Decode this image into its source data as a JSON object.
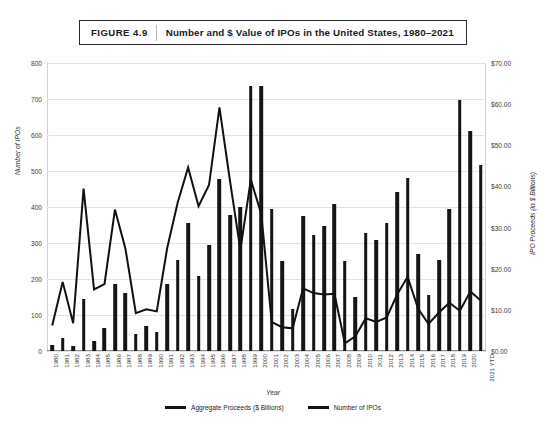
{
  "figure": {
    "number_label": "FIGURE 4.9",
    "title": "Number and $ Value of IPOs in the United States, 1980–2021"
  },
  "axes": {
    "x_title": "Year",
    "y_left_title": "Number of IPOs",
    "y_right_title": "IPO Proceeds (in $ Billions)"
  },
  "legend": {
    "items": [
      {
        "label": "Aggregate Proceeds ($ Billions)",
        "marker": "bar-swatch"
      },
      {
        "label": "Number of IPOs",
        "marker": "line-swatch"
      }
    ]
  },
  "chart_data": {
    "type": "bar",
    "title": "Number and $ Value of IPOs in the United States, 1980–2021",
    "xlabel": "Year",
    "ylabel": "Number of IPOs",
    "y2label": "IPO Proceeds (in $ Billions)",
    "ylim": [
      0,
      800
    ],
    "y2lim": [
      0,
      70
    ],
    "yticks": [
      0,
      100,
      200,
      300,
      400,
      500,
      600,
      700,
      800
    ],
    "ytick_labels": [
      "0",
      "100",
      "200",
      "300",
      "400",
      "500",
      "600",
      "700",
      "800"
    ],
    "y2ticks": [
      0,
      10,
      20,
      30,
      40,
      50,
      60,
      70
    ],
    "y2tick_labels": [
      "$0.00",
      "$10.00",
      "$20.00",
      "$30.00",
      "$40.00",
      "$50.00",
      "$60.00",
      "$70.00"
    ],
    "grid": true,
    "legend_position": "bottom",
    "categories": [
      "1980",
      "1981",
      "1982",
      "1983",
      "1984",
      "1985",
      "1986",
      "1987",
      "1988",
      "1989",
      "1990",
      "1991",
      "1992",
      "1993",
      "1994",
      "1995",
      "1996",
      "1997",
      "1998",
      "1999",
      "2000",
      "2001",
      "2002",
      "2003",
      "2004",
      "2005",
      "2006",
      "2007",
      "2008",
      "2009",
      "2010",
      "2011",
      "2012",
      "2013",
      "2014",
      "2015",
      "2016",
      "2017",
      "2018",
      "2019",
      "2020",
      "2021 YTD"
    ],
    "series": [
      {
        "name": "Aggregate Proceeds ($ Billions)",
        "axis": "right",
        "unit": "$ Billions",
        "type": "bar",
        "values": [
          1.4,
          3.2,
          1.3,
          12.6,
          2.5,
          5.7,
          16.4,
          14.2,
          4.1,
          6.2,
          4.6,
          16.4,
          22.2,
          31.2,
          18.3,
          25.7,
          41.8,
          33.0,
          35.0,
          64.3,
          64.3,
          34.6,
          22.0,
          10.1,
          32.8,
          28.2,
          30.5,
          35.7,
          22.0,
          13.2,
          28.6,
          27.0,
          31.1,
          38.6,
          42.0,
          23.7,
          13.7,
          22.1,
          34.6,
          61.0,
          53.4,
          45.3
        ]
      },
      {
        "name": "Number of IPOs",
        "axis": "left",
        "unit": "count",
        "type": "line",
        "values": [
          71,
          192,
          77,
          451,
          171,
          186,
          393,
          285,
          105,
          116,
          110,
          286,
          412,
          510,
          402,
          461,
          677,
          474,
          281,
          476,
          380,
          80,
          66,
          63,
          174,
          161,
          157,
          159,
          21,
          41,
          91,
          81,
          93,
          157,
          206,
          118,
          75,
          107,
          134,
          112,
          165,
          140
        ]
      }
    ]
  }
}
